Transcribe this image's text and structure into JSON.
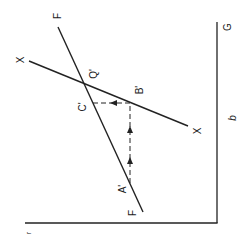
{
  "diagram": {
    "orientation": "rotated 90 degrees clockwise",
    "colors": {
      "line": "#222222",
      "background": "#ffffff"
    },
    "axes": {
      "vertical_axis_label": "G",
      "horizontal_axis_label": "r",
      "side_label": "b"
    },
    "lines": [
      {
        "name": "F",
        "start_label": "F",
        "end_label": "F"
      },
      {
        "name": "X",
        "start_label": "X",
        "end_label": "X"
      }
    ],
    "points": {
      "intersection": "Q'",
      "b_point": "B'",
      "c_point": "C'",
      "a_point": "A'"
    },
    "labels": {
      "f_top": "F",
      "f_bottom": "F",
      "x_top": "X",
      "x_bottom": "X",
      "q": "Q'",
      "b": "B'",
      "c": "C'",
      "a": "A'",
      "g": "G",
      "b_axis": "b",
      "r_axis": "r"
    },
    "path": {
      "description": "Dashed path from A' up to B', then across to C', with direction arrows",
      "segments": [
        "A' → B'",
        "B' → C'"
      ]
    }
  }
}
